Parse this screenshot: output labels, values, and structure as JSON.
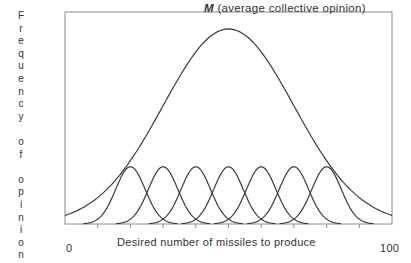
{
  "chart_data": {
    "type": "line",
    "title": "",
    "annotation": {
      "symbol": "M",
      "text": "(average collective opinion)"
    },
    "xlabel": "Desired number of missiles to produce",
    "ylabel": "Frequency of opinion",
    "x_tick_labels": {
      "min": "0",
      "max": "100"
    },
    "xlim": [
      0,
      100
    ],
    "grid": false,
    "legend": "none",
    "series": [
      {
        "name": "Collective opinion distribution (M)",
        "kind": "gaussian",
        "mean": 50,
        "sd": 20,
        "peak": 0.92,
        "offset": 0
      },
      {
        "name": "Individual 1",
        "kind": "gaussian",
        "mean": 20,
        "sd": 4.5,
        "peak": 0.27
      },
      {
        "name": "Individual 2",
        "kind": "gaussian",
        "mean": 30,
        "sd": 4.5,
        "peak": 0.27
      },
      {
        "name": "Individual 3",
        "kind": "gaussian",
        "mean": 40,
        "sd": 4.5,
        "peak": 0.27
      },
      {
        "name": "Individual 4",
        "kind": "gaussian",
        "mean": 50,
        "sd": 4.5,
        "peak": 0.27
      },
      {
        "name": "Individual 5",
        "kind": "gaussian",
        "mean": 60,
        "sd": 4.5,
        "peak": 0.27
      },
      {
        "name": "Individual 6",
        "kind": "gaussian",
        "mean": 70,
        "sd": 4.5,
        "peak": 0.27
      },
      {
        "name": "Individual 7",
        "kind": "gaussian",
        "mean": 80,
        "sd": 4.5,
        "peak": 0.27
      }
    ],
    "x_ticks": [
      10,
      20,
      30,
      40,
      50,
      60,
      70,
      80,
      90
    ]
  },
  "labels": {
    "annotation_symbol": "M",
    "annotation_text": "(average collective opinion)",
    "xlabel": "Desired number of missiles to produce",
    "x0": "0",
    "x100": "100",
    "ylabel_words": [
      "Frequency",
      "of",
      "opinion"
    ]
  },
  "colors": {
    "line": "#3a3a3a",
    "frame": "#8a8a8a",
    "text": "#333333"
  }
}
